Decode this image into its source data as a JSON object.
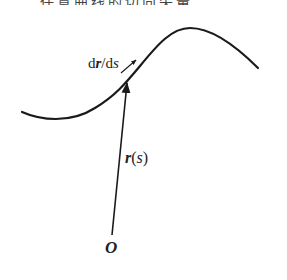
{
  "header": {
    "text": "任意曲线的切向矢量"
  },
  "diagram": {
    "labels": {
      "tangent": {
        "d1": "d",
        "r": "r",
        "slash": "/",
        "d2": "d",
        "s": "s"
      },
      "position_vector": {
        "r": "r",
        "open": "(",
        "s": "s",
        "close": ")"
      },
      "origin": "O"
    },
    "colors": {
      "stroke": "#1a1a1a",
      "text": "#222222",
      "background": "#ffffff"
    }
  }
}
